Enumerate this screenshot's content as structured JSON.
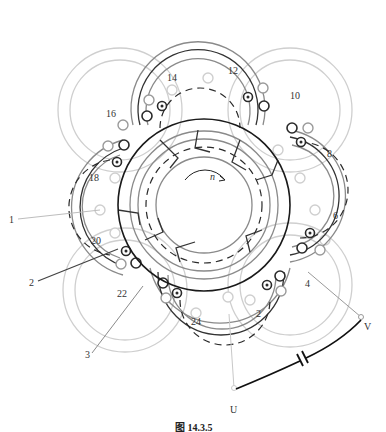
{
  "figure": {
    "caption": "图 14.3.5",
    "rotation_label": "n",
    "terminals": {
      "u": "U",
      "v": "V"
    },
    "slot_labels": {
      "s14": "14",
      "s12": "12",
      "s10": "10",
      "s16": "16",
      "s8": "8",
      "s18": "18",
      "s6": "6",
      "s20": "20",
      "s4": "4",
      "s22": "22",
      "s24": "24",
      "s2": "2"
    },
    "lead_labels": {
      "l1": "1",
      "l2": "2",
      "l3": "3"
    },
    "colors": {
      "main_winding": "#1a1a1a",
      "secondary_winding": "#8a8a8a",
      "auxiliary_winding": "#cfcfcf",
      "background": "#ffffff"
    }
  }
}
